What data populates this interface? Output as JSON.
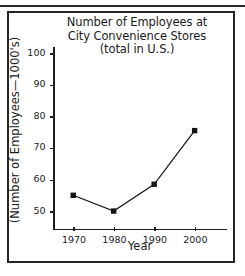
{
  "chart_data": {
    "type": "line",
    "title": "Number of Employees at City Convenience Stores (total in U.S.)",
    "title_lines": [
      "Number of Employees at",
      "City Convenience Stores",
      "(total in U.S.)"
    ],
    "xlabel": "Year",
    "ylabel": "(Number of Employees—1000's)",
    "x": [
      1970,
      1980,
      1990,
      2000
    ],
    "xticklabels": [
      "1970",
      "1980",
      "1990",
      "2000"
    ],
    "values": [
      55,
      50,
      58.5,
      75.5
    ],
    "yticks": [
      50,
      60,
      70,
      80,
      90,
      100
    ],
    "yticklabels": [
      "50",
      "60",
      "70",
      "80",
      "90",
      "100"
    ],
    "xlim": [
      1965,
      2008
    ],
    "ylim": [
      44,
      102
    ],
    "grid": false,
    "legend": false,
    "marker": "square",
    "marker_color": "#141414",
    "line_color": "#141414"
  },
  "figure": {
    "border_color": "#252525",
    "background": "#ffffff"
  }
}
